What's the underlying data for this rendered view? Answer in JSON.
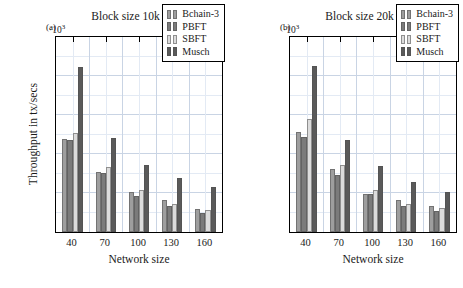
{
  "figure": {
    "ylabel": "Throughput in tx/secs",
    "xlabel": "Network size",
    "sci_multiplier": "·10",
    "sci_exponent": "3"
  },
  "legend": {
    "entries": [
      {
        "label": "Bchain-3",
        "color": "#9e9e9e"
      },
      {
        "label": "PBFT",
        "color": "#7b7b7b"
      },
      {
        "label": "SBFT",
        "color": "#dcdcdc"
      },
      {
        "label": "Musch",
        "color": "#5a5a5a"
      }
    ]
  },
  "chart_data": [
    {
      "type": "bar",
      "title": "Block size 10k",
      "panel_label": "(a)",
      "xlabel": "Network size",
      "ylabel": "Throughput in tx/secs",
      "y_multiplier": 1000,
      "ylim": [
        0,
        5
      ],
      "yticks": [
        0,
        1,
        2,
        3,
        4,
        5
      ],
      "grid": true,
      "legend_position": "top-right",
      "categories": [
        "40",
        "70",
        "100",
        "130",
        "160"
      ],
      "series": [
        {
          "name": "Bchain-3",
          "color": "#9e9e9e",
          "values": [
            2.38,
            1.54,
            1.03,
            0.82,
            0.6
          ]
        },
        {
          "name": "PBFT",
          "color": "#7b7b7b",
          "values": [
            2.37,
            1.51,
            0.93,
            0.67,
            0.5
          ]
        },
        {
          "name": "SBFT",
          "color": "#dcdcdc",
          "values": [
            2.55,
            1.67,
            1.08,
            0.73,
            0.57
          ]
        },
        {
          "name": "Musch",
          "color": "#5a5a5a",
          "values": [
            4.23,
            2.4,
            1.73,
            1.39,
            1.15
          ]
        }
      ]
    },
    {
      "type": "bar",
      "title": "Block size 20k",
      "panel_label": "(b)",
      "xlabel": "Network size",
      "ylabel": "Throughput in tx/secs",
      "y_multiplier": 1000,
      "ylim": [
        0,
        5
      ],
      "yticks": [
        0,
        1,
        2,
        3,
        4,
        5
      ],
      "grid": true,
      "legend_position": "top-right",
      "categories": [
        "40",
        "70",
        "100",
        "130",
        "160"
      ],
      "series": [
        {
          "name": "Bchain-3",
          "color": "#9e9e9e",
          "values": [
            2.57,
            1.62,
            0.98,
            0.82,
            0.66
          ]
        },
        {
          "name": "PBFT",
          "color": "#7b7b7b",
          "values": [
            2.43,
            1.47,
            0.97,
            0.67,
            0.55
          ]
        },
        {
          "name": "SBFT",
          "color": "#dcdcdc",
          "values": [
            2.89,
            1.73,
            1.07,
            0.72,
            0.61
          ]
        },
        {
          "name": "Musch",
          "color": "#5a5a5a",
          "values": [
            4.26,
            2.37,
            1.68,
            1.29,
            1.02
          ]
        }
      ]
    }
  ]
}
